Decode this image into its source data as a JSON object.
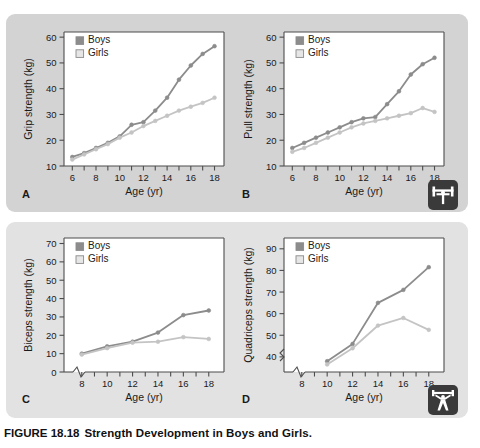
{
  "figure": {
    "caption_label": "FIGURE 18.18",
    "caption_title": "Strength Development in Boys and Girls.",
    "panel_letters": {
      "a": "A",
      "b": "B",
      "c": "C",
      "d": "D"
    },
    "icons": {
      "upper": "bench-press-icon",
      "lower": "weightlifter-icon"
    },
    "colors": {
      "panel_top_background": "#d3d3d3",
      "panel_bottom_background": "#e2e2e2",
      "plot_background": "#ffffff",
      "boys_line": "#8c8c8c",
      "girls_line": "#c4c4c4",
      "axis": "#4d4d4d",
      "text": "#1a1a1a"
    }
  },
  "chart_data": [
    {
      "id": "A",
      "type": "line",
      "title": "",
      "xlabel": "Age (yr)",
      "ylabel": "Grip strength (kg)",
      "xlim": [
        5.3,
        18.8
      ],
      "ylim": [
        10,
        62
      ],
      "xticks": [
        6,
        7,
        8,
        9,
        10,
        11,
        12,
        13,
        14,
        15,
        16,
        17,
        18
      ],
      "xticklabels": [
        "6",
        "",
        "8",
        "",
        "10",
        "",
        "12",
        "",
        "14",
        "",
        "16",
        "",
        "18"
      ],
      "yticks": [
        10,
        20,
        30,
        40,
        50,
        60
      ],
      "yticklabels": [
        "10",
        "20",
        "30",
        "40",
        "50",
        "60"
      ],
      "grid": false,
      "axis_break_x": false,
      "axis_break_y": false,
      "legend": [
        "Boys",
        "Girls"
      ],
      "legend_position": "top-left",
      "x": [
        6,
        7,
        8,
        9,
        10,
        11,
        12,
        13,
        14,
        15,
        16,
        17,
        18
      ],
      "series": [
        {
          "name": "Boys",
          "values": [
            13.5,
            15.0,
            17.0,
            19.0,
            21.5,
            26.0,
            27.0,
            31.5,
            36.5,
            43.5,
            49.0,
            53.5,
            56.5
          ]
        },
        {
          "name": "Girls",
          "values": [
            12.5,
            14.5,
            16.5,
            18.5,
            21.0,
            23.0,
            25.5,
            27.5,
            29.5,
            31.5,
            33.0,
            34.5,
            36.5
          ]
        }
      ]
    },
    {
      "id": "B",
      "type": "line",
      "title": "",
      "xlabel": "Age (yr)",
      "ylabel": "Pull strength (kg)",
      "xlim": [
        5.3,
        18.8
      ],
      "ylim": [
        10,
        62
      ],
      "xticks": [
        6,
        7,
        8,
        9,
        10,
        11,
        12,
        13,
        14,
        15,
        16,
        17,
        18
      ],
      "xticklabels": [
        "6",
        "",
        "8",
        "",
        "10",
        "",
        "12",
        "",
        "14",
        "",
        "16",
        "",
        "18"
      ],
      "yticks": [
        10,
        20,
        30,
        40,
        50,
        60
      ],
      "yticklabels": [
        "10",
        "20",
        "30",
        "40",
        "50",
        "60"
      ],
      "grid": false,
      "axis_break_x": false,
      "axis_break_y": false,
      "legend": [
        "Boys",
        "Girls"
      ],
      "legend_position": "top-left",
      "x": [
        6,
        7,
        8,
        9,
        10,
        11,
        12,
        13,
        14,
        15,
        16,
        17,
        18
      ],
      "series": [
        {
          "name": "Boys",
          "values": [
            17.0,
            19.0,
            21.0,
            23.0,
            25.0,
            27.0,
            28.5,
            29.0,
            34.0,
            39.0,
            45.5,
            49.5,
            52.0
          ]
        },
        {
          "name": "Girls",
          "values": [
            15.5,
            17.0,
            19.0,
            21.0,
            23.0,
            25.0,
            26.5,
            27.5,
            28.5,
            29.5,
            30.5,
            32.5,
            31.0
          ]
        }
      ]
    },
    {
      "id": "C",
      "type": "line",
      "title": "",
      "xlabel": "Age (yr)",
      "ylabel": "Biceps strength (kg)",
      "xlim": [
        6.6,
        19.2
      ],
      "ylim": [
        0,
        73
      ],
      "xticks": [
        8,
        9,
        10,
        11,
        12,
        13,
        14,
        15,
        16,
        17,
        18
      ],
      "xticklabels": [
        "8",
        "",
        "10",
        "",
        "12",
        "",
        "14",
        "",
        "16",
        "",
        "18"
      ],
      "yticks": [
        0,
        10,
        20,
        30,
        40,
        50,
        60,
        70
      ],
      "yticklabels": [
        "0",
        "10",
        "20",
        "30",
        "40",
        "50",
        "60",
        "70"
      ],
      "grid": false,
      "axis_break_x": true,
      "axis_break_y": false,
      "legend": [
        "Boys",
        "Girls"
      ],
      "legend_position": "top-left",
      "x": [
        8,
        10,
        12,
        14,
        16,
        18
      ],
      "series": [
        {
          "name": "Boys",
          "values": [
            10.0,
            14.0,
            16.5,
            21.5,
            31.0,
            33.5
          ]
        },
        {
          "name": "Girls",
          "values": [
            9.5,
            13.0,
            16.0,
            16.5,
            19.0,
            18.0
          ]
        }
      ]
    },
    {
      "id": "D",
      "type": "line",
      "title": "",
      "xlabel": "Age (yr)",
      "ylabel": "Quadriceps strength (kg)",
      "xlim": [
        6.6,
        19.2
      ],
      "ylim": [
        33,
        95
      ],
      "xticks": [
        8,
        9,
        10,
        11,
        12,
        13,
        14,
        15,
        16,
        17,
        18
      ],
      "xticklabels": [
        "8",
        "",
        "10",
        "",
        "12",
        "",
        "14",
        "",
        "16",
        "",
        "18"
      ],
      "yticks": [
        40,
        50,
        60,
        70,
        80,
        90
      ],
      "yticklabels": [
        "40",
        "50",
        "60",
        "70",
        "80",
        "90"
      ],
      "grid": false,
      "axis_break_x": true,
      "axis_break_y": true,
      "legend": [
        "Boys",
        "Girls"
      ],
      "legend_position": "top-left",
      "x": [
        10,
        12,
        14,
        16,
        18
      ],
      "series": [
        {
          "name": "Boys",
          "values": [
            38.0,
            46.0,
            65.0,
            71.0,
            81.5
          ]
        },
        {
          "name": "Girls",
          "values": [
            36.5,
            44.0,
            54.5,
            58.0,
            52.5
          ]
        }
      ]
    }
  ]
}
